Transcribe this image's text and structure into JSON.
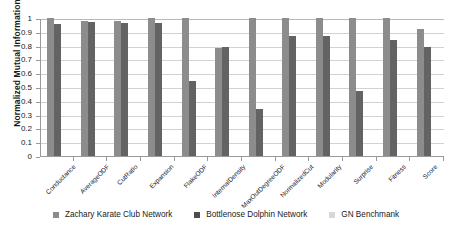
{
  "chart_data": {
    "type": "bar",
    "title": "",
    "xlabel": "",
    "ylabel": "Normalized Mutual Information",
    "ylim": [
      0,
      1
    ],
    "yticks": [
      "0",
      "0.1",
      "0.2",
      "0.3",
      "0.4",
      "0.5",
      "0.6",
      "0.7",
      "0.8",
      "0.9",
      "1"
    ],
    "grid": true,
    "legend_position": "bottom",
    "categories": [
      "Conductance",
      "AverageODF",
      "CutRatio",
      "Expansion",
      "FlakeODF",
      "InternalDensity",
      "MaxOutDegreeODF",
      "NormalizedCut",
      "Modularity",
      "Surprise",
      "Fitness",
      "Score"
    ],
    "series": [
      {
        "name": "Zachary Karate Club Network",
        "color": "#8c8c8c",
        "values": [
          1.0,
          0.98,
          0.98,
          1.0,
          1.0,
          0.78,
          1.0,
          1.0,
          1.0,
          1.0,
          1.0,
          0.92
        ]
      },
      {
        "name": "Bottlenose Dolphin Network",
        "color": "#636363",
        "values": [
          0.955,
          0.97,
          0.965,
          0.965,
          0.54,
          0.79,
          0.34,
          0.87,
          0.87,
          0.47,
          0.84,
          0.79
        ]
      },
      {
        "name": "GN Benchmank",
        "color": "#d8d8d8",
        "values": [
          0,
          0,
          0,
          0,
          0,
          0,
          0,
          0,
          0,
          0,
          0,
          0
        ]
      }
    ]
  },
  "legend": {
    "items": [
      {
        "label": "Zachary Karate Club Network"
      },
      {
        "label": "Bottlenose Dolphin Network"
      },
      {
        "label": "GN Benchmank"
      }
    ]
  }
}
